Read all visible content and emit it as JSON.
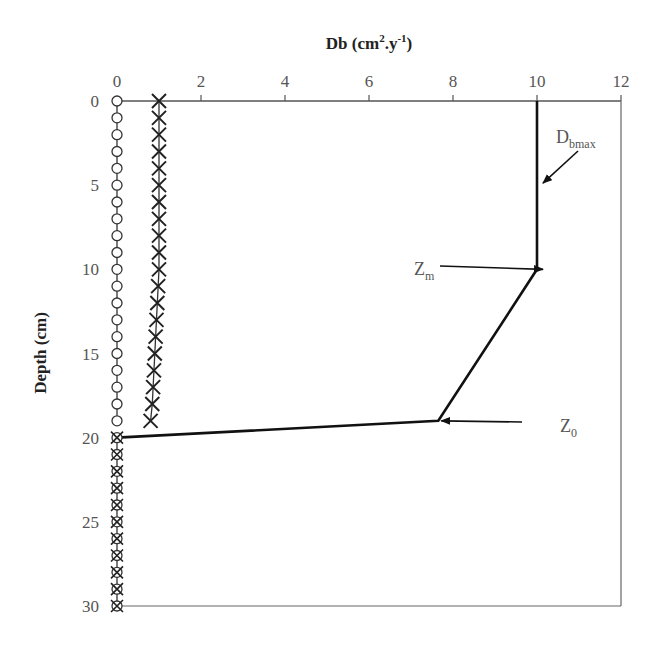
{
  "chart_data": {
    "type": "line",
    "title": "",
    "xlabel": "Db (cm².y⁻¹)",
    "xlabel_parts": {
      "base": "Db (cm",
      "sup1": "2",
      "mid": ".y",
      "sup2": "-1",
      "end": ")"
    },
    "ylabel": "Depth (cm)",
    "xlim": [
      0,
      12
    ],
    "ylim": [
      0,
      30
    ],
    "y_inverted": true,
    "x_axis_position": "top",
    "x_ticks": [
      0,
      2,
      4,
      6,
      8,
      10,
      12
    ],
    "y_ticks": [
      0,
      5,
      10,
      15,
      20,
      25,
      30
    ],
    "grid": false,
    "legend": null,
    "series": [
      {
        "name": "Db profile (solid line)",
        "style": "line",
        "points": [
          [
            10,
            0
          ],
          [
            10,
            10
          ],
          [
            7.65,
            19
          ],
          [
            0,
            20
          ]
        ]
      },
      {
        "name": "open circles",
        "style": "circle-markers",
        "x": [
          0,
          0,
          0,
          0,
          0,
          0,
          0,
          0,
          0,
          0,
          0,
          0,
          0,
          0,
          0,
          0,
          0,
          0,
          0,
          0
        ],
        "depth": [
          0,
          1,
          2,
          3,
          4,
          5,
          6,
          7,
          8,
          9,
          10,
          11,
          12,
          13,
          14,
          15,
          16,
          17,
          18,
          19
        ]
      },
      {
        "name": "crosses",
        "style": "x-markers",
        "x": [
          1.0,
          1.0,
          1.0,
          1.0,
          1.0,
          1.0,
          1.0,
          1.0,
          1.0,
          1.0,
          1.0,
          0.98,
          0.96,
          0.94,
          0.92,
          0.9,
          0.88,
          0.86,
          0.84,
          0.8
        ],
        "depth": [
          0,
          1,
          2,
          3,
          4,
          5,
          6,
          7,
          8,
          9,
          10,
          11,
          12,
          13,
          14,
          15,
          16,
          17,
          18,
          19
        ]
      },
      {
        "name": "crossed circles (below 20 cm)",
        "style": "circle-x-markers",
        "x": [
          0,
          0,
          0,
          0,
          0,
          0,
          0,
          0,
          0,
          0,
          0
        ],
        "depth": [
          20,
          21,
          22,
          23,
          24,
          25,
          26,
          27,
          28,
          29,
          30
        ]
      }
    ],
    "annotations": [
      {
        "label": "D",
        "sub": "bmax",
        "arrow_to": [
          10,
          5
        ]
      },
      {
        "label": "Z",
        "sub": "m",
        "arrow_to": [
          10,
          10
        ]
      },
      {
        "label": "Z",
        "sub": "0",
        "arrow_to": [
          7.65,
          19
        ]
      }
    ]
  }
}
